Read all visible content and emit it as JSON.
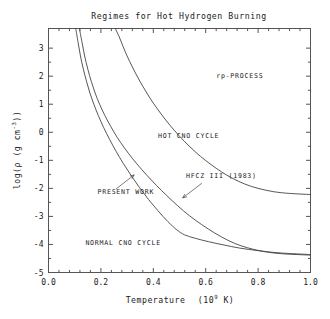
{
  "chart_data": {
    "type": "line",
    "title": "Regimes for Hot Hydrogen Burning",
    "xlabel_text": "Temperature",
    "xlabel_units_pre": "(10",
    "xlabel_units_exp": "9",
    "xlabel_units_post": " K)",
    "ylabel_pre": "log(ρ (g cm",
    "ylabel_exp": "-3",
    "ylabel_post": "))",
    "xlim": [
      0.0,
      1.0
    ],
    "ylim": [
      -5,
      3.7
    ],
    "xticks": [
      "0.0",
      "0.2",
      "0.4",
      "0.6",
      "0.8",
      "1.0"
    ],
    "xtick_values": [
      0.0,
      0.2,
      0.4,
      0.6,
      0.8,
      1.0
    ],
    "xminor_count": 4,
    "yticks": [
      "3",
      "2",
      "1",
      "0",
      "-1",
      "-2",
      "-3",
      "-4",
      "-5"
    ],
    "ytick_values": [
      3,
      2,
      1,
      0,
      -1,
      -2,
      -3,
      -4,
      -5
    ],
    "grid": false,
    "legend": "none",
    "series": [
      {
        "name": "rp-PROCESS boundary",
        "points": [
          [
            0.255,
            3.7
          ],
          [
            0.27,
            3.4
          ],
          [
            0.285,
            3.05
          ],
          [
            0.3,
            2.72
          ],
          [
            0.32,
            2.33
          ],
          [
            0.34,
            1.97
          ],
          [
            0.36,
            1.64
          ],
          [
            0.38,
            1.33
          ],
          [
            0.4,
            1.04
          ],
          [
            0.43,
            0.65
          ],
          [
            0.46,
            0.29
          ],
          [
            0.5,
            -0.14
          ],
          [
            0.54,
            -0.52
          ],
          [
            0.58,
            -0.86
          ],
          [
            0.62,
            -1.15
          ],
          [
            0.66,
            -1.41
          ],
          [
            0.7,
            -1.63
          ],
          [
            0.75,
            -1.85
          ],
          [
            0.8,
            -2.0
          ],
          [
            0.86,
            -2.12
          ],
          [
            0.92,
            -2.18
          ],
          [
            1.0,
            -2.22
          ]
        ]
      },
      {
        "name": "HFCZ III (1983) boundary",
        "points": [
          [
            0.118,
            3.7
          ],
          [
            0.128,
            3.2
          ],
          [
            0.138,
            2.72
          ],
          [
            0.15,
            2.25
          ],
          [
            0.163,
            1.82
          ],
          [
            0.178,
            1.4
          ],
          [
            0.195,
            1.0
          ],
          [
            0.215,
            0.6
          ],
          [
            0.238,
            0.2
          ],
          [
            0.262,
            -0.18
          ],
          [
            0.29,
            -0.56
          ],
          [
            0.32,
            -0.93
          ],
          [
            0.355,
            -1.32
          ],
          [
            0.392,
            -1.7
          ],
          [
            0.432,
            -2.08
          ],
          [
            0.472,
            -2.44
          ],
          [
            0.515,
            -2.8
          ],
          [
            0.56,
            -3.13
          ],
          [
            0.61,
            -3.45
          ],
          [
            0.66,
            -3.73
          ],
          [
            0.71,
            -3.96
          ],
          [
            0.76,
            -4.12
          ],
          [
            0.82,
            -4.25
          ],
          [
            0.89,
            -4.33
          ],
          [
            1.0,
            -4.38
          ]
        ]
      },
      {
        "name": "PRESENT WORK boundary",
        "points": [
          [
            0.104,
            3.7
          ],
          [
            0.113,
            3.2
          ],
          [
            0.122,
            2.72
          ],
          [
            0.133,
            2.25
          ],
          [
            0.145,
            1.82
          ],
          [
            0.158,
            1.4
          ],
          [
            0.173,
            1.0
          ],
          [
            0.19,
            0.6
          ],
          [
            0.21,
            0.18
          ],
          [
            0.233,
            -0.25
          ],
          [
            0.258,
            -0.68
          ],
          [
            0.286,
            -1.12
          ],
          [
            0.316,
            -1.55
          ],
          [
            0.348,
            -1.98
          ],
          [
            0.382,
            -2.4
          ],
          [
            0.418,
            -2.8
          ],
          [
            0.455,
            -3.18
          ],
          [
            0.49,
            -3.48
          ],
          [
            0.52,
            -3.66
          ],
          [
            0.56,
            -3.78
          ],
          [
            0.61,
            -3.9
          ],
          [
            0.67,
            -4.02
          ],
          [
            0.73,
            -4.13
          ],
          [
            0.8,
            -4.22
          ],
          [
            0.88,
            -4.3
          ],
          [
            1.0,
            -4.36
          ]
        ]
      }
    ],
    "annotations": [
      {
        "id": "rp-process-label",
        "text": "rp-PROCESS",
        "x": 0.73,
        "y": 1.95,
        "anchor": "middle"
      },
      {
        "id": "hot-cno-cycle-label",
        "text": "HOT CNO CYCLE",
        "x": 0.535,
        "y": -0.22,
        "anchor": "middle"
      },
      {
        "id": "hfcz-label",
        "text": "HFCZ III (1983)",
        "x": 0.66,
        "y": -1.62,
        "anchor": "middle"
      },
      {
        "id": "present-work-label",
        "text": "PRESENT WORK",
        "x": 0.295,
        "y": -2.2,
        "anchor": "middle"
      },
      {
        "id": "normal-cno-cycle-label",
        "text": "NORMAL CNO CYCLE",
        "x": 0.285,
        "y": -4.03,
        "anchor": "middle"
      }
    ],
    "leaders": [
      {
        "id": "hfcz-leader",
        "from": [
          0.585,
          -1.82
        ],
        "to": [
          0.512,
          -2.34
        ]
      },
      {
        "id": "present-work-leader",
        "from": [
          0.258,
          -2.02
        ],
        "to": [
          0.327,
          -1.52
        ]
      }
    ]
  }
}
